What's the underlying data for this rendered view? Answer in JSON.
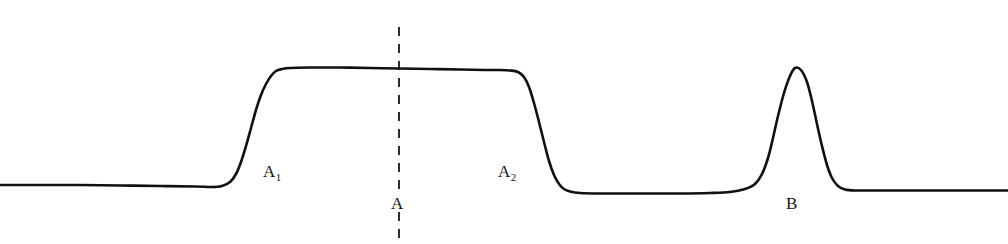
{
  "figure": {
    "type": "signal-trace",
    "background_color": "#ffffff",
    "trace_color": "#101010",
    "trace_width": 2.6,
    "guide_color": "#151515",
    "labels": {
      "plateau_left_shoulder": "A",
      "plateau_left_shoulder_sub": "1",
      "plateau_right_shoulder": "A",
      "plateau_right_shoulder_sub": "2",
      "plateau_center": "A",
      "gaussian_peak": "B"
    }
  },
  "chart_data": {
    "type": "line",
    "title": "",
    "xlabel": "",
    "ylabel": "",
    "grid": false,
    "legend": null,
    "xlim": [
      0,
      1008
    ],
    "ylim": [
      244,
      0
    ],
    "axes_visible": false,
    "series": [
      {
        "name": "trace",
        "color": "#101010",
        "width": 2.6,
        "description": "Baseline, broad flat-topped plateau peak A spanning A1 to A2, return to baseline, then narrow Gaussian peak B, then baseline.",
        "points": [
          [
            0,
            185
          ],
          [
            40,
            185
          ],
          [
            80,
            185
          ],
          [
            120,
            185.5
          ],
          [
            160,
            186
          ],
          [
            195,
            186.5
          ],
          [
            212,
            187
          ],
          [
            222,
            186
          ],
          [
            230,
            182
          ],
          [
            236,
            174
          ],
          [
            241,
            162
          ],
          [
            246,
            146
          ],
          [
            251,
            128
          ],
          [
            256,
            110
          ],
          [
            261,
            95
          ],
          [
            266,
            84
          ],
          [
            271,
            76
          ],
          [
            276,
            71
          ],
          [
            282,
            69
          ],
          [
            290,
            68
          ],
          [
            310,
            67.5
          ],
          [
            340,
            67.5
          ],
          [
            370,
            68
          ],
          [
            399,
            68.5
          ],
          [
            430,
            69
          ],
          [
            460,
            69.5
          ],
          [
            485,
            70
          ],
          [
            500,
            70
          ],
          [
            510,
            70.5
          ],
          [
            518,
            72
          ],
          [
            524,
            77
          ],
          [
            529,
            87
          ],
          [
            534,
            103
          ],
          [
            539,
            122
          ],
          [
            544,
            142
          ],
          [
            549,
            161
          ],
          [
            554,
            175
          ],
          [
            559,
            184
          ],
          [
            564,
            189
          ],
          [
            570,
            191.5
          ],
          [
            580,
            193
          ],
          [
            600,
            193.5
          ],
          [
            640,
            193.5
          ],
          [
            680,
            193.5
          ],
          [
            710,
            193
          ],
          [
            730,
            192
          ],
          [
            745,
            189
          ],
          [
            755,
            184
          ],
          [
            762,
            174
          ],
          [
            768,
            158
          ],
          [
            773,
            138
          ],
          [
            778,
            116
          ],
          [
            784,
            93
          ],
          [
            790,
            76
          ],
          [
            795,
            68
          ],
          [
            801,
            70
          ],
          [
            807,
            82
          ],
          [
            812,
            101
          ],
          [
            817,
            124
          ],
          [
            822,
            146
          ],
          [
            827,
            165
          ],
          [
            832,
            178
          ],
          [
            838,
            186
          ],
          [
            845,
            189.5
          ],
          [
            855,
            190.5
          ],
          [
            880,
            190.5
          ],
          [
            920,
            190.5
          ],
          [
            960,
            190.5
          ],
          [
            1008,
            190.5
          ]
        ]
      }
    ],
    "annotations": [
      {
        "name": "plateau-center-guide",
        "kind": "vertical-dashed-line",
        "x": 399,
        "y_start": 27,
        "y_end": 244,
        "dash": [
          9,
          8
        ],
        "color": "#151515",
        "width": 1.8,
        "gap_for_label": [
          192,
          212
        ]
      },
      {
        "name": "label-A1",
        "text": "A",
        "subscript": "1",
        "x": 263,
        "y": 163
      },
      {
        "name": "label-A2",
        "text": "A",
        "subscript": "2",
        "x": 498,
        "y": 163
      },
      {
        "name": "label-A",
        "text": "A",
        "subscript": "",
        "x": 391,
        "y": 195
      },
      {
        "name": "label-B",
        "text": "B",
        "subscript": "",
        "x": 786,
        "y": 195
      }
    ],
    "features": [
      {
        "name": "plateau-peak-A",
        "shape": "flat-top",
        "onset_x": 215,
        "offset_x": 572,
        "top_y": 68,
        "baseline_y": 185,
        "label": "A"
      },
      {
        "name": "gaussian-peak-B",
        "shape": "gaussian",
        "apex_x": 795,
        "apex_y": 68,
        "baseline_y": 191,
        "fwhm_px": 36,
        "label": "B"
      }
    ]
  }
}
